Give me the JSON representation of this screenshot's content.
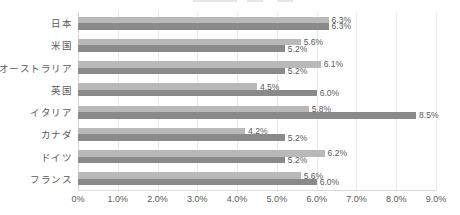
{
  "chart_data": {
    "type": "bar",
    "orientation": "horizontal",
    "title": "",
    "categories": [
      "日本",
      "米国",
      "オーストラリア",
      "英国",
      "イタリア",
      "カナダ",
      "ドイツ",
      "フランス"
    ],
    "series": [
      {
        "name": "series-light-gray",
        "color": "#b9b9b9",
        "values": [
          6.3,
          5.6,
          6.1,
          4.5,
          5.8,
          4.2,
          6.2,
          5.6
        ],
        "data_labels": [
          "6.3%",
          "5.6%",
          "6.1%",
          "4.5%",
          "5.8%",
          "4.2%",
          "6.2%",
          "5.6%"
        ]
      },
      {
        "name": "series-dark-gray",
        "color": "#8a8a8a",
        "values": [
          6.3,
          5.2,
          5.2,
          6.0,
          8.5,
          5.2,
          5.2,
          6.0
        ],
        "data_labels": [
          "6.3%",
          "5.2%",
          "5.2%",
          "6.0%",
          "8.5%",
          "5.2%",
          "5.2%",
          "6.0%"
        ]
      }
    ],
    "x_axis": {
      "min": 0,
      "max": 9,
      "tick_values": [
        0,
        1,
        2,
        3,
        4,
        5,
        6,
        7,
        8,
        9
      ],
      "tick_labels": [
        "0%",
        "1.0%",
        "2.0%",
        "3.0%",
        "4.0%",
        "5.0%",
        "6.0%",
        "7.0%",
        "8.0%",
        "9.0%"
      ]
    },
    "grid": true,
    "legend": "clipped at top edge of image",
    "colors": {
      "background": "#ffffff",
      "gridline": "#e9e9e9",
      "axis_text": "#595959",
      "data_label_text": "#595959",
      "category_text": "#595959"
    }
  }
}
